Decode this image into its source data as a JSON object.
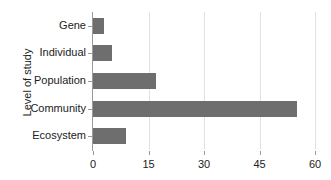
{
  "chart_data": {
    "type": "bar",
    "orientation": "horizontal",
    "title": "",
    "xlabel": "",
    "ylabel": "Level of study",
    "categories": [
      "Gene",
      "Individual",
      "Population",
      "Community",
      "Ecosystem"
    ],
    "values": [
      3,
      5,
      17,
      55,
      9
    ],
    "xlim": [
      0,
      60
    ],
    "xticks": [
      0,
      15,
      30,
      45,
      60
    ],
    "xtick_labels": [
      "0",
      "15",
      "30",
      "45",
      "60"
    ],
    "grid": true,
    "grid_axis": "x",
    "legend": false,
    "bar_color": "#6e6e6e",
    "grid_color": "#e2e2e2",
    "axis_color": "#9a9a9a",
    "background_color": "#ffffff",
    "text_color": "#222222"
  }
}
